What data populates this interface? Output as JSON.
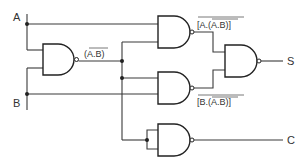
{
  "diagram": {
    "inputs": [
      {
        "id": "A",
        "label": "A"
      },
      {
        "id": "B",
        "label": "B"
      }
    ],
    "outputs": [
      {
        "id": "S",
        "label": "S"
      },
      {
        "id": "C",
        "label": "C"
      }
    ],
    "gates": [
      {
        "id": "g1",
        "type": "NAND",
        "inputs": [
          "A",
          "B"
        ],
        "output_label": "(A.B)",
        "output_overline": true
      },
      {
        "id": "g2",
        "type": "NAND",
        "inputs": [
          "A",
          "g1"
        ],
        "output_label": "[A.(A.B)]",
        "output_overline": true
      },
      {
        "id": "g3",
        "type": "NAND",
        "inputs": [
          "g1",
          "B"
        ],
        "output_label": "[B.(A.B)]",
        "output_overline": true
      },
      {
        "id": "g4",
        "type": "NAND",
        "inputs": [
          "g2",
          "g3"
        ],
        "output": "S"
      },
      {
        "id": "g5",
        "type": "NAND",
        "inputs": [
          "g1",
          "g1"
        ],
        "output": "C"
      }
    ],
    "labels": {
      "a": "A",
      "b": "B",
      "s": "S",
      "c": "C",
      "g1_out": "(A.B)",
      "g2_out": "[A.(A.B)]",
      "g3_out": "[B.(A.B)]"
    }
  }
}
